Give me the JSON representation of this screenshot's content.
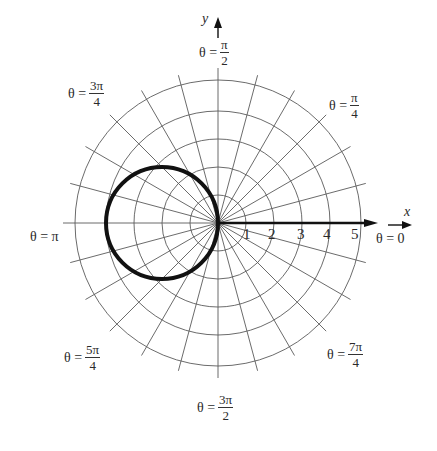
{
  "figure": {
    "type": "polar graph",
    "axis_x_name": "x",
    "axis_y_name": "y",
    "center_px": [
      218,
      223
    ],
    "unit_px": 28,
    "max_radius": 5,
    "radial_line_step_deg": 15,
    "grid_color": "#555555",
    "curve_color": "#111111"
  },
  "labels": {
    "theta_0": {
      "lhs": "θ = 0"
    },
    "theta_pi_4": {
      "lhs": "θ =",
      "num": "π",
      "den": "4"
    },
    "theta_pi_2": {
      "lhs": "θ =",
      "num": "π",
      "den": "2"
    },
    "theta_3pi_4": {
      "lhs": "θ =",
      "num": "3π",
      "den": "4"
    },
    "theta_pi": {
      "lhs": "θ = π"
    },
    "theta_5pi_4": {
      "lhs": "θ =",
      "num": "5π",
      "den": "4"
    },
    "theta_3pi_2": {
      "lhs": "θ =",
      "num": "3π",
      "den": "2"
    },
    "theta_7pi_4": {
      "lhs": "θ =",
      "num": "7π",
      "den": "4"
    }
  },
  "ticks": [
    "1",
    "2",
    "3",
    "4",
    "5"
  ],
  "chart_data": {
    "type": "polar",
    "title": "",
    "curve": "r = -4 cos θ (circle of diameter 4 centered at (-2, 0))",
    "series": [
      {
        "name": "curve",
        "center_xy": [
          -2,
          0
        ],
        "radius": 2
      }
    ],
    "radial_ticks": [
      1,
      2,
      3,
      4,
      5
    ],
    "angle_labels": [
      "0",
      "π/4",
      "π/2",
      "3π/4",
      "π",
      "5π/4",
      "3π/2",
      "7π/4"
    ],
    "grid": true,
    "radial_lines_every": "π/12",
    "xlabel": "x",
    "ylabel": "y"
  }
}
